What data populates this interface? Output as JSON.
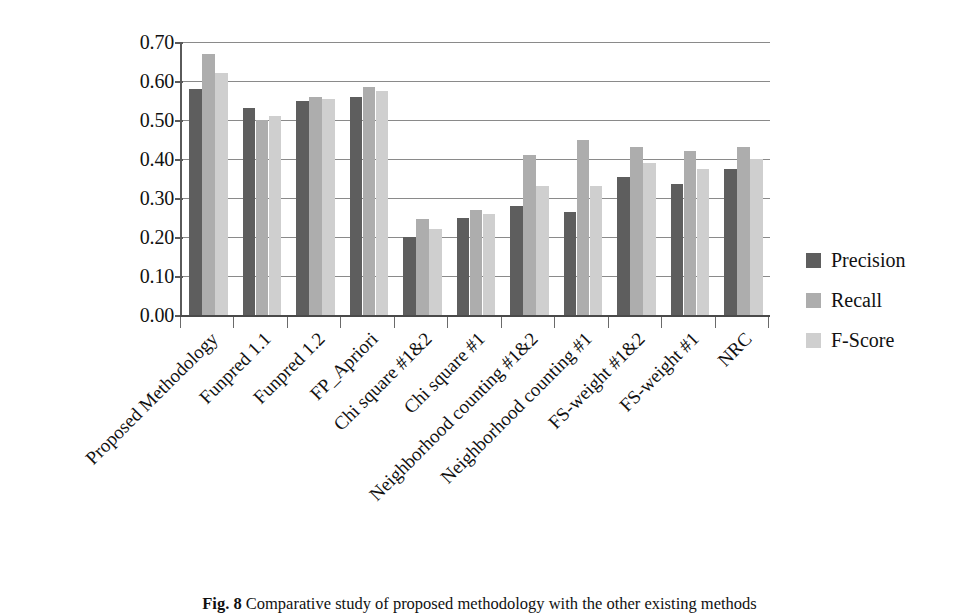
{
  "chart_data": {
    "type": "bar",
    "title": "",
    "xlabel": "",
    "ylabel": "",
    "ylim": [
      0.0,
      0.7
    ],
    "ytick_labels": [
      "0.70",
      "0.60",
      "0.50",
      "0.40",
      "0.30",
      "0.20",
      "0.10",
      "0.00"
    ],
    "ytick_values": [
      0.7,
      0.6,
      0.5,
      0.4,
      0.3,
      0.2,
      0.1,
      0.0
    ],
    "grid": true,
    "legend_position": "right",
    "categories": [
      "Proposed Methodology",
      "Funpred 1.1",
      "Funpred 1.2",
      "FP_Apriori",
      "Chi square #1&2",
      "Chi square #1",
      "Neighborhood counting #1&2",
      "Neighborhood counting #1",
      "FS-weight #1&2",
      "FS-weight #1",
      "NRC"
    ],
    "series": [
      {
        "name": "Precision",
        "color": "#5e5e5e",
        "values": [
          0.58,
          0.53,
          0.55,
          0.56,
          0.2,
          0.25,
          0.28,
          0.265,
          0.355,
          0.335,
          0.375
        ]
      },
      {
        "name": "Recall",
        "color": "#adadad",
        "values": [
          0.67,
          0.5,
          0.56,
          0.585,
          0.245,
          0.27,
          0.41,
          0.45,
          0.43,
          0.42,
          0.43
        ]
      },
      {
        "name": "F-Score",
        "color": "#cfcfcf",
        "values": [
          0.62,
          0.51,
          0.555,
          0.575,
          0.22,
          0.26,
          0.33,
          0.33,
          0.39,
          0.375,
          0.4
        ]
      }
    ]
  },
  "legend": {
    "items": [
      {
        "label": "Precision",
        "swatch": "precision"
      },
      {
        "label": "Recall",
        "swatch": "recall"
      },
      {
        "label": "F-Score",
        "swatch": "fscore"
      }
    ]
  },
  "caption": {
    "figure_number": "Fig. 8",
    "text": "Comparative study of proposed methodology with the other existing methods",
    "full": "Fig. 8  Comparative study of proposed methodology with the other existing methods"
  }
}
